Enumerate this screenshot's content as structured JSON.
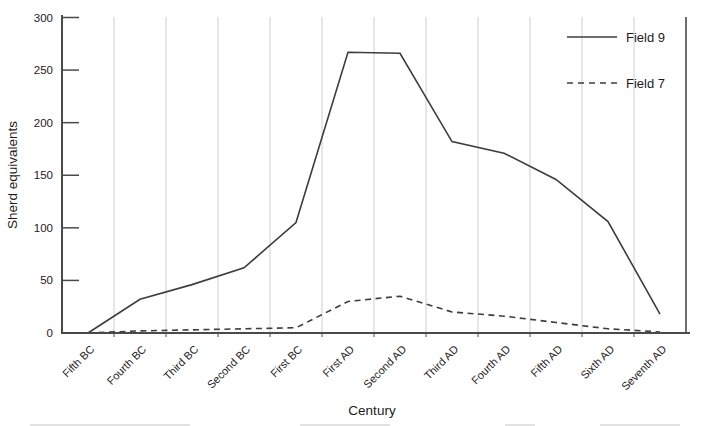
{
  "chart_data": {
    "type": "line",
    "title": "",
    "xlabel": "Century",
    "ylabel": "Sherd equivalents",
    "ylim": [
      0,
      300
    ],
    "yticks": [
      0,
      50,
      100,
      150,
      200,
      250,
      300
    ],
    "grid": "vertical-gridlines-between-categories",
    "legend_position": "top-right-inside",
    "categories": [
      "Fifth BC",
      "Fourth BC",
      "Third BC",
      "Second BC",
      "First BC",
      "First AD",
      "Second AD",
      "Third AD",
      "Fourth AD",
      "Fifth AD",
      "Sixth AD",
      "Seventh AD"
    ],
    "series": [
      {
        "name": "Field 9",
        "style": "solid",
        "color": "#3d3d3d",
        "values": [
          0,
          32,
          46,
          62,
          105,
          267,
          266,
          182,
          171,
          146,
          106,
          18
        ]
      },
      {
        "name": "Field 7",
        "style": "dashed",
        "color": "#3d3d3d",
        "values": [
          0,
          2,
          3,
          4,
          5,
          30,
          35,
          20,
          16,
          10,
          4,
          1
        ]
      }
    ]
  },
  "colors": {
    "background": "#ffffff",
    "line": "#3d3d3d",
    "axis": "#4a4a4a",
    "gridline": "#cfcfcf",
    "text": "#1c1c1c"
  }
}
